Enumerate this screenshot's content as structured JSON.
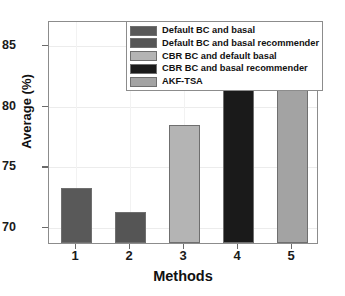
{
  "chart_data": {
    "type": "bar",
    "title": "",
    "xlabel": "Methods",
    "ylabel": "Average (%)",
    "categories": [
      "1",
      "2",
      "3",
      "4",
      "5"
    ],
    "values": [
      73.1,
      71.2,
      78.3,
      83.2,
      83.9
    ],
    "series": [
      {
        "name": "Average (%)",
        "values": [
          73.1,
          71.2,
          78.3,
          83.2,
          83.9
        ]
      }
    ],
    "bar_colors": [
      "#595959",
      "#555555",
      "#b4b4b4",
      "#1a1a1a",
      "#a3a3a3"
    ],
    "xlim": [
      0.5,
      5.5
    ],
    "ylim": [
      68.6,
      87.0
    ],
    "yticks": [
      "70",
      "75",
      "80",
      "85"
    ],
    "ytick_values": [
      70,
      75,
      80,
      85
    ],
    "xticks": [
      "1",
      "2",
      "3",
      "4",
      "5"
    ],
    "grid": true,
    "legend_position": "top-right",
    "legend": [
      {
        "label": "Default BC and basal",
        "color": "#595959"
      },
      {
        "label": "Default BC and basal recommender",
        "color": "#555555"
      },
      {
        "label": "CBR BC and default basal",
        "color": "#b4b4b4"
      },
      {
        "label": "CBR BC and basal recommender",
        "color": "#1a1a1a"
      },
      {
        "label": "AKF-TSA",
        "color": "#a3a3a3"
      }
    ]
  },
  "colors": {
    "axis": "#8c8c8c",
    "grid": "#ececec",
    "text": "#111111",
    "background": "#ffffff"
  }
}
